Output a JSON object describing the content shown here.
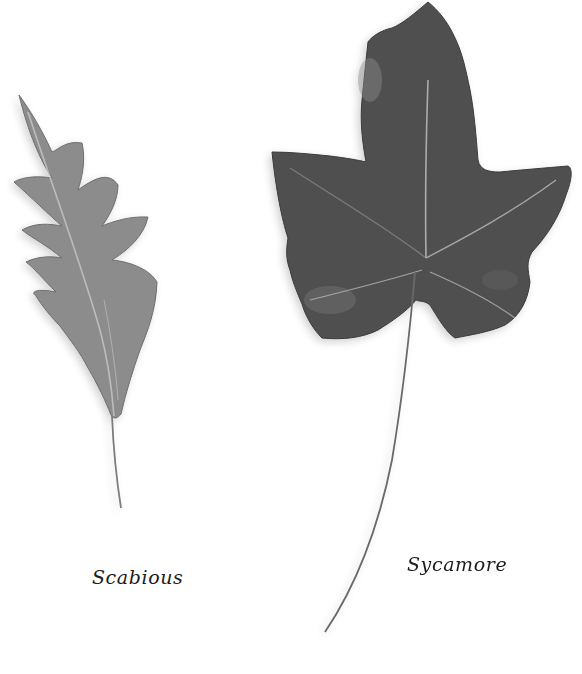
{
  "specimens": [
    {
      "name": "Scabious",
      "position": "left",
      "leaf_type": "pinnately lobed, lanceolate with slender stalk"
    },
    {
      "name": "Sycamore",
      "position": "right",
      "leaf_type": "palmate, five-lobed with long petiole"
    }
  ],
  "colors": {
    "background": "#ffffff",
    "scabious_leaf": "#8a8a8a",
    "sycamore_leaf": "#4e4e4e",
    "caption_text": "#1c1c1c"
  }
}
